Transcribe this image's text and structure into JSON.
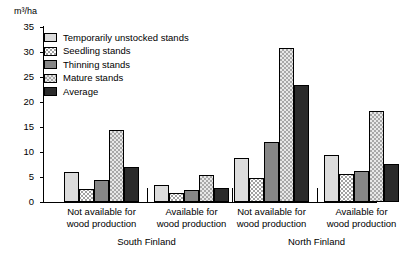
{
  "chart_data": {
    "type": "bar",
    "title": "",
    "xlabel": "",
    "ylabel": "m³/ha",
    "ylim": [
      0,
      35
    ],
    "yticks": [
      0,
      5,
      10,
      15,
      20,
      25,
      30,
      35
    ],
    "grid": false,
    "legend_position": "top-left",
    "categories": [
      "Not available for wood production",
      "Available for wood production",
      "Not available for wood production",
      "Available for wood production"
    ],
    "category_lines": [
      [
        "Not available for",
        "wood production"
      ],
      [
        "Available for",
        "wood production"
      ],
      [
        "Not available for",
        "wood production"
      ],
      [
        "Available for",
        "wood production"
      ]
    ],
    "groups": [
      {
        "label": "South Finland",
        "categories": [
          0,
          1
        ]
      },
      {
        "label": "North Finland",
        "categories": [
          2,
          3
        ]
      }
    ],
    "series": [
      {
        "name": "Temporarily unstocked stands",
        "key": "temp",
        "values": [
          6.0,
          3.5,
          8.9,
          9.4
        ]
      },
      {
        "name": "Seedling stands",
        "key": "seed",
        "values": [
          2.7,
          1.8,
          4.9,
          5.6
        ]
      },
      {
        "name": "Thinning stands",
        "key": "thin",
        "values": [
          4.5,
          2.4,
          12.0,
          6.2
        ]
      },
      {
        "name": "Mature stands",
        "key": "mature",
        "values": [
          14.5,
          5.5,
          30.8,
          18.3
        ]
      },
      {
        "name": "Average",
        "key": "avg",
        "values": [
          7.0,
          2.8,
          23.4,
          7.7
        ]
      }
    ]
  },
  "colors": {
    "temporarily_unstocked": "#dcdcdc",
    "seedling": "#ffffff",
    "thinning": "#868686",
    "mature": "#e8e8e8",
    "average": "#2b2b2b",
    "axis": "#000000",
    "background": "#ffffff"
  }
}
